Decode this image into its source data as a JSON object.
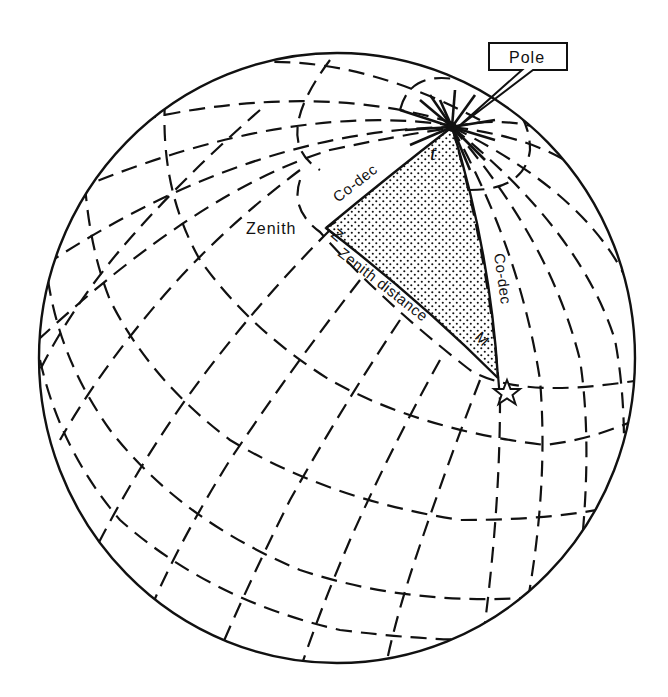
{
  "figure": {
    "type": "celestial sphere diagram",
    "colors": {
      "ink": "#111111",
      "background": "#ffffff",
      "stipple": "#111111"
    }
  },
  "labels": {
    "pole": "Pole",
    "zenith": "Zenith",
    "zenith_vertex": "Z",
    "hour_angle": "t",
    "co_dec_upper": "Co-dec",
    "co_dec_right": "Co-dec",
    "zenith_distance": "Zenith distance",
    "star_vertex": "M"
  },
  "markers": {
    "star_icon": "☆"
  },
  "caption": {
    "visible": "partially clipped at bottom edge",
    "text": ""
  }
}
